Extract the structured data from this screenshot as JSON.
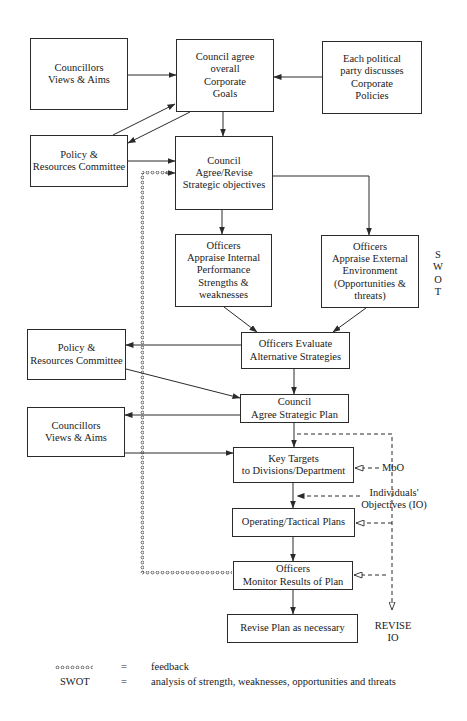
{
  "diagram": {
    "title": "",
    "boxes": [
      {
        "id": "councillors-1",
        "text": "Councillors\nViews & Aims",
        "x": 30,
        "y": 38,
        "w": 98,
        "h": 72
      },
      {
        "id": "corporate-goals",
        "text": "Council agree\noverall\nCorporate\nGoals",
        "x": 176,
        "y": 39,
        "w": 98,
        "h": 73
      },
      {
        "id": "political-party",
        "text": "Each political\nparty discusses\nCorporate\nPolicies",
        "x": 322,
        "y": 41,
        "w": 100,
        "h": 73
      },
      {
        "id": "policy-resources-1",
        "text": "Policy &\nResources Committee",
        "x": 30,
        "y": 135,
        "w": 98,
        "h": 52
      },
      {
        "id": "strategic-objectives",
        "text": "Council\nAgree/Revise\nStrategic objectives",
        "x": 175,
        "y": 136,
        "w": 98,
        "h": 74
      },
      {
        "id": "appraise-internal",
        "text": "Officers\nAppraise Internal\nPerformance\nStrengths &\nweaknesses",
        "x": 175,
        "y": 234,
        "w": 97,
        "h": 73
      },
      {
        "id": "appraise-external",
        "text": "Officers\nAppraise External\nEnvironment\n(Opportunities &\nthreats)",
        "x": 321,
        "y": 235,
        "w": 98,
        "h": 73
      },
      {
        "id": "policy-resources-2",
        "text": "Policy &\nResources Committee",
        "x": 27,
        "y": 329,
        "w": 99,
        "h": 51
      },
      {
        "id": "evaluate-strategies",
        "text": "Officers Evaluate\nAlternative Strategies",
        "x": 241,
        "y": 332,
        "w": 109,
        "h": 37
      },
      {
        "id": "strategic-plan",
        "text": "Council\nAgree Strategic Plan",
        "x": 240,
        "y": 394,
        "w": 109,
        "h": 29
      },
      {
        "id": "councillors-2",
        "text": "Councillors\nViews & Aims",
        "x": 27,
        "y": 407,
        "w": 98,
        "h": 50
      },
      {
        "id": "key-targets",
        "text": "Key Targets\nto Divisions/Department",
        "x": 233,
        "y": 447,
        "w": 121,
        "h": 36
      },
      {
        "id": "operating-plans",
        "text": "Operating/Tactical Plans",
        "x": 232,
        "y": 508,
        "w": 123,
        "h": 29
      },
      {
        "id": "monitor-results",
        "text": "Officers\nMonitor Results of Plan",
        "x": 233,
        "y": 561,
        "w": 120,
        "h": 29
      },
      {
        "id": "revise-plan",
        "text": "Revise Plan as necessary",
        "x": 227,
        "y": 614,
        "w": 131,
        "h": 29
      }
    ],
    "side_labels": {
      "swot": "S\nW\nO\nT",
      "mbo": "MbO",
      "individuals_objectives": "Individuals'\nObjectives (IO)",
      "revise_io": "REVISE\nIO"
    },
    "colors": {
      "line": "#2a2a2a",
      "background": "#ffffff"
    }
  },
  "legend": {
    "rows": [
      {
        "symbol": "feedback-chain",
        "symbol_text": "",
        "equals": "=",
        "meaning": "feedback"
      },
      {
        "symbol": "text",
        "symbol_text": "SWOT",
        "equals": "=",
        "meaning": "analysis of strength, weaknesses, opportunities and threats"
      }
    ]
  }
}
